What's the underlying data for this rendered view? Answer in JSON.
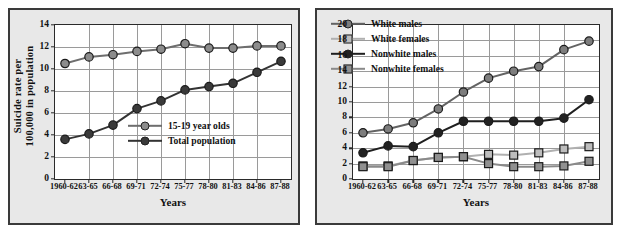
{
  "chart_data": [
    {
      "type": "line",
      "panel": "left",
      "title": "",
      "xlabel": "Years",
      "ylabel_lines": [
        "Suicide rate per",
        "100,000 in population"
      ],
      "ylabel": "Suicide rate per 100,000 in population",
      "categories": [
        "1960-62",
        "63-65",
        "66-68",
        "69-71",
        "72-74",
        "75-77",
        "78-80",
        "81-83",
        "84-86",
        "87-88"
      ],
      "ylim": [
        0,
        14
      ],
      "yticks": [
        0,
        2,
        4,
        6,
        8,
        10,
        12,
        14
      ],
      "grid": true,
      "legend_position": "inside-lower-right",
      "series": [
        {
          "name": "15-19 year olds",
          "color": "#6e6e6e",
          "marker": "circle",
          "marker_fill": "#8c8c8c",
          "values": [
            10.5,
            11.1,
            11.3,
            11.6,
            11.8,
            12.3,
            11.9,
            11.9,
            12.1,
            12.1
          ]
        },
        {
          "name": "Total population",
          "color": "#333333",
          "marker": "circle",
          "marker_fill": "#3a3a3a",
          "values": [
            3.6,
            4.1,
            4.9,
            6.4,
            7.1,
            8.1,
            8.4,
            8.7,
            9.7,
            10.7
          ]
        }
      ]
    },
    {
      "type": "line",
      "panel": "right",
      "title": "",
      "xlabel": "Years",
      "ylabel": "",
      "categories": [
        "1960-62",
        "63-65",
        "66-68",
        "69-71",
        "72-74",
        "75-77",
        "78-80",
        "81-83",
        "84-86",
        "87-88"
      ],
      "ylim": [
        0,
        20
      ],
      "yticks": [
        0,
        2,
        4,
        6,
        8,
        10,
        12,
        14,
        16,
        18,
        20
      ],
      "grid": true,
      "legend_position": "inside-upper-left",
      "series": [
        {
          "name": "White males",
          "color": "#636363",
          "marker": "circle",
          "marker_fill": "#7d7d7d",
          "values": [
            6.0,
            6.5,
            7.3,
            9.1,
            11.3,
            13.1,
            14.0,
            14.6,
            16.8,
            17.9
          ]
        },
        {
          "name": "White females",
          "color": "#b0b0b0",
          "marker": "square",
          "marker_fill": "#bdbdbd",
          "values": [
            1.7,
            1.7,
            2.4,
            2.8,
            2.9,
            3.2,
            3.1,
            3.4,
            3.9,
            4.2
          ]
        },
        {
          "name": "Nonwhite males",
          "color": "#1f1f1f",
          "marker": "circle",
          "marker_fill": "#222222",
          "values": [
            3.4,
            4.3,
            4.2,
            6.0,
            7.5,
            7.5,
            7.5,
            7.5,
            7.9,
            10.3
          ]
        },
        {
          "name": "Nonwhite females",
          "color": "#8a8a8a",
          "marker": "square",
          "marker_fill": "#909090",
          "values": [
            1.6,
            1.6,
            2.4,
            2.8,
            2.9,
            2.0,
            1.6,
            1.6,
            1.7,
            2.3
          ]
        }
      ]
    }
  ]
}
